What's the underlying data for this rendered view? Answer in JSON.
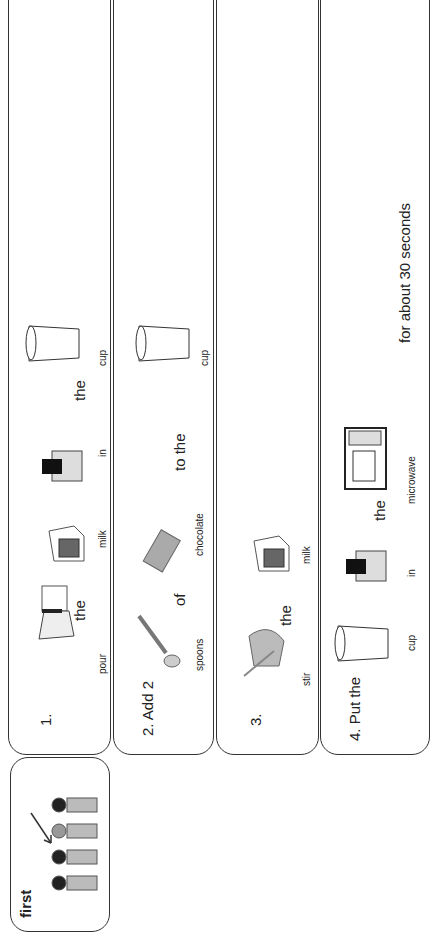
{
  "first_panel": {
    "label": "first",
    "icon": "children-queue-icon",
    "arrow": "arrow-icon"
  },
  "steps": [
    {
      "number": "1.",
      "words": {
        "pour": "pour",
        "the": "the",
        "milk": "milk",
        "in": "in",
        "the2": "the",
        "cup": "cup"
      }
    },
    {
      "number": "2. Add 2",
      "words": {
        "spoons": "spoons",
        "of": "of",
        "chocolate": "chocolate",
        "to_the": "to the",
        "cup": "cup"
      }
    },
    {
      "number": "3.",
      "words": {
        "stir": "stir",
        "the": "the",
        "milk": "milk"
      }
    },
    {
      "number": "4. Put the",
      "words": {
        "cup": "cup",
        "in": "in",
        "the": "the",
        "microwave": "microwave",
        "duration": "for about 30 seconds"
      }
    }
  ],
  "colors": {
    "border": "#333333",
    "text": "#222222",
    "background": "#ffffff"
  }
}
